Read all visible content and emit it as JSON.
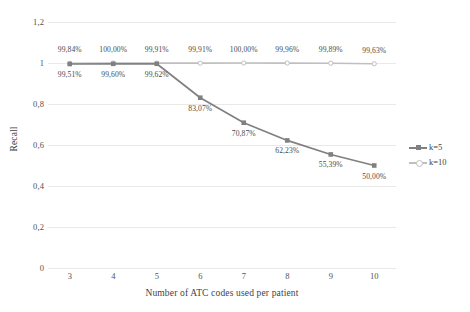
{
  "chart_data": {
    "type": "line",
    "title": "",
    "xlabel": "Number of ATC codes used per patient",
    "ylabel": "Recall",
    "x": [
      3,
      4,
      5,
      6,
      7,
      8,
      9,
      10
    ],
    "xtick_labels": [
      "3",
      "4",
      "5",
      "6",
      "7",
      "8",
      "9",
      "10"
    ],
    "ytick_labels": [
      "1,2",
      "1",
      "0,8",
      "0,6",
      "0,4",
      "0,2",
      "0"
    ],
    "ytick_values": [
      1.2,
      1.0,
      0.8,
      0.6,
      0.4,
      0.2,
      0
    ],
    "ylim": [
      0,
      1.2
    ],
    "grid": "horizontal",
    "legend_position": "right",
    "series": [
      {
        "name": "k=5",
        "color": "#808080",
        "marker": "square",
        "values": [
          0.9951,
          0.996,
          0.9962,
          0.8307,
          0.7087,
          0.6223,
          0.5539,
          0.5
        ],
        "labels": [
          "99,51%",
          "99,60%",
          "99,62%",
          "83,07%",
          "70,87%",
          "62,23%",
          "55,39%",
          "50,00%"
        ],
        "label_position": "below"
      },
      {
        "name": "k=10",
        "color": "#bfbfbf",
        "marker": "circle",
        "values": [
          0.9984,
          1.0,
          0.9991,
          0.9991,
          1.0,
          0.9996,
          0.9989,
          0.9963
        ],
        "labels": [
          "99,84%",
          "100,00%",
          "99,91%",
          "99,91%",
          "100,00%",
          "99,96%",
          "99,89%",
          "99,63%"
        ],
        "label_position": "above"
      }
    ]
  },
  "legend": {
    "items": [
      {
        "label": "k=5"
      },
      {
        "label": "k=10"
      }
    ]
  },
  "colors": {
    "series_k5": "#808080",
    "series_k10": "#bfbfbf",
    "gridline": "#e9e9e9",
    "text": "#3f3f3f",
    "background": "#ffffff"
  }
}
